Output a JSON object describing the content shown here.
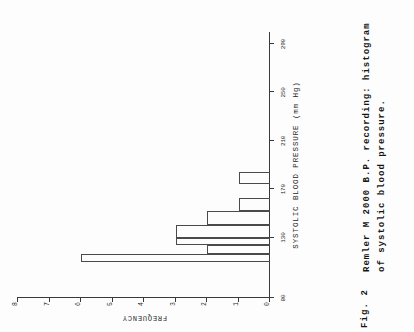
{
  "figure": {
    "label": "Fig. 2",
    "caption_lines": [
      "Remler M 2000 B.P. recording: histogram",
      "of systolic blood pressure."
    ]
  },
  "chart_data": {
    "type": "bar",
    "title": "",
    "xlabel": "SYSTOLIC  BLOOD  PRESSURE  (mm Hg)",
    "ylabel": "FREQUENCY",
    "xlim": [
      80,
      300
    ],
    "ylim": [
      0,
      8
    ],
    "xticks": [
      80,
      130,
      170,
      210,
      250,
      290
    ],
    "xtick_labels": [
      "80",
      "130",
      "170",
      "210",
      "250",
      "290"
    ],
    "yticks": [
      0,
      1,
      2,
      3,
      4,
      5,
      6,
      7,
      8
    ],
    "ytick_labels": [
      "0",
      "1",
      "2",
      "3",
      "4",
      "5",
      "6",
      "7",
      "8"
    ],
    "grid": false,
    "legend": null,
    "bins": [
      {
        "start": 110,
        "end": 116,
        "value": 6
      },
      {
        "start": 116,
        "end": 124,
        "value": 2
      },
      {
        "start": 124,
        "end": 130,
        "value": 3
      },
      {
        "start": 130,
        "end": 140,
        "value": 3
      },
      {
        "start": 140,
        "end": 152,
        "value": 2
      },
      {
        "start": 152,
        "end": 163,
        "value": 1
      },
      {
        "start": 174,
        "end": 184,
        "value": 1
      }
    ]
  }
}
